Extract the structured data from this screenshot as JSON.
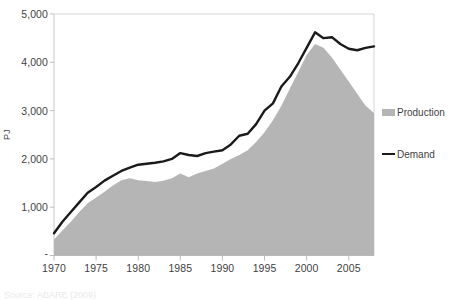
{
  "chart_data": {
    "type": "area",
    "title": "",
    "xlabel": "",
    "ylabel": "PJ",
    "xlim": [
      1970,
      2008
    ],
    "ylim": [
      0,
      5000
    ],
    "grid": false,
    "legend_position": "right",
    "x_tick_labels": [
      "1970",
      "1975",
      "1980",
      "1985",
      "1990",
      "1995",
      "2000",
      "2005"
    ],
    "x_ticks": [
      1970,
      1975,
      1980,
      1985,
      1990,
      1995,
      2000,
      2005
    ],
    "y_tick_labels": [
      "5,000",
      "4,000",
      "3,000",
      "2,000",
      "1,000",
      "-"
    ],
    "y_ticks": [
      5000,
      4000,
      3000,
      2000,
      1000,
      0
    ],
    "x": [
      1970,
      1971,
      1972,
      1973,
      1974,
      1975,
      1976,
      1977,
      1978,
      1979,
      1980,
      1981,
      1982,
      1983,
      1984,
      1985,
      1986,
      1987,
      1988,
      1989,
      1990,
      1991,
      1992,
      1993,
      1994,
      1995,
      1996,
      1997,
      1998,
      1999,
      2000,
      2001,
      2002,
      2003,
      2004,
      2005,
      2006,
      2007,
      2008
    ],
    "series": [
      {
        "name": "Production",
        "type": "area",
        "color": "#b5b5b5",
        "values": [
          330,
          520,
          700,
          900,
          1080,
          1200,
          1320,
          1450,
          1560,
          1600,
          1560,
          1540,
          1520,
          1550,
          1600,
          1700,
          1620,
          1700,
          1750,
          1800,
          1900,
          2000,
          2080,
          2180,
          2350,
          2550,
          2800,
          3100,
          3450,
          3800,
          4150,
          4380,
          4300,
          4100,
          3850,
          3600,
          3350,
          3100,
          2950
        ]
      },
      {
        "name": "Demand",
        "type": "line",
        "color": "#1a1a1a",
        "values": [
          460,
          700,
          900,
          1100,
          1300,
          1420,
          1550,
          1650,
          1750,
          1820,
          1880,
          1900,
          1920,
          1950,
          2000,
          2120,
          2080,
          2060,
          2120,
          2150,
          2180,
          2300,
          2480,
          2520,
          2720,
          3000,
          3150,
          3500,
          3700,
          3980,
          4300,
          4620,
          4500,
          4520,
          4380,
          4280,
          4250,
          4300,
          4330
        ]
      }
    ]
  },
  "legend": {
    "items": [
      {
        "label": "Production",
        "marker": "area-swatch"
      },
      {
        "label": "Demand",
        "marker": "line-swatch"
      }
    ]
  },
  "caption": {
    "text": "Source: ABARE (2009)"
  }
}
